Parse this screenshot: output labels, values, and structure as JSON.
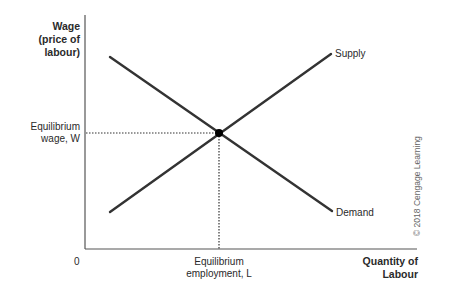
{
  "diagram": {
    "y_axis": {
      "label_line1": "Wage",
      "label_line2": "(price of",
      "label_line3": "labour)"
    },
    "x_axis": {
      "label_line1": "Quantity of",
      "label_line2": "Labour"
    },
    "origin_label": "0",
    "curves": [
      {
        "name": "Supply",
        "from": [
          110,
          212
        ],
        "to": [
          331,
          54
        ]
      },
      {
        "name": "Demand",
        "from": [
          110,
          57
        ],
        "to": [
          332,
          211
        ]
      }
    ],
    "equilibrium": {
      "point": [
        219,
        133
      ],
      "wage_label_line1": "Equilibrium",
      "wage_label_line2": "wage, W",
      "employment_label_line1": "Equilibrium",
      "employment_label_line2": "employment, L"
    },
    "credit": "© 2018 Cengage Learning",
    "colors": {
      "line": "#333333",
      "axis": "#444444",
      "dot": "#000000"
    }
  }
}
